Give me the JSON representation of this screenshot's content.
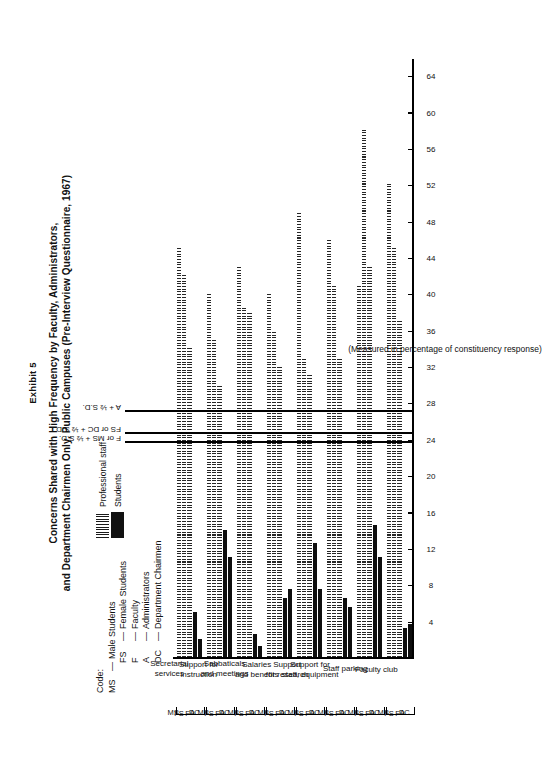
{
  "exhibit": {
    "label": "Exhibit 5"
  },
  "title": {
    "line1": "Concerns Shared with High Frequency by Faculty, Administrators,",
    "line2": "and Department Chairmen Only, Public Campuses (Pre-Interview Questionnaire, 1967)"
  },
  "code_key": {
    "heading": "Code:",
    "dash": "—",
    "entries": [
      {
        "abbr": "MS",
        "meaning": "Male Students"
      },
      {
        "abbr": "FS",
        "meaning": "Female Students"
      },
      {
        "abbr": "F",
        "meaning": "Faculty"
      },
      {
        "abbr": "A",
        "meaning": "Administrators"
      },
      {
        "abbr": "DC",
        "meaning": "Department Chairmen"
      }
    ]
  },
  "pattern_key": [
    {
      "name": "Professional staff",
      "fill": "striped"
    },
    {
      "name": "Students",
      "fill": "solid"
    }
  ],
  "reference_lines": [
    {
      "label": "A + ½  S.D.",
      "value": 27.2
    },
    {
      "label": "FS or DC + ½  S.D.",
      "value": 24.8
    },
    {
      "label": "F or MS + ½  S.D.",
      "value": 23.8
    }
  ],
  "chart_data": {
    "type": "bar",
    "orientation": "horizontal",
    "title": "Concerns Shared with High Frequency by Faculty, Administrators, and Department Chairmen Only, Public Campuses (Pre-Interview Questionnaire, 1967)",
    "xlabel": "(Measured in percentage of constituency response)",
    "ylabel": "",
    "xlim": [
      0,
      66
    ],
    "grid": false,
    "ticks": [
      4,
      8,
      12,
      16,
      20,
      24,
      28,
      32,
      36,
      40,
      44,
      48,
      52,
      56,
      60,
      64
    ],
    "legend_position": "top-left",
    "group_codes": [
      "DC",
      "A",
      "F",
      "FS",
      "MS"
    ],
    "code_order_printed": "MS FS  F   A  DC",
    "series": [
      {
        "name": "Professional staff",
        "fill": "striped",
        "members": [
          "DC",
          "A",
          "F"
        ]
      },
      {
        "name": "Students",
        "fill": "solid",
        "members": [
          "FS",
          "MS"
        ]
      }
    ],
    "categories": [
      {
        "name": "Secretarial services",
        "name_lines": [
          "Secretarial",
          "services"
        ],
        "bars": [
          {
            "code": "DC",
            "value": 45.0,
            "fill": "striped"
          },
          {
            "code": "A",
            "value": 42.0,
            "fill": "striped"
          },
          {
            "code": "F",
            "value": 34.0,
            "fill": "striped"
          },
          {
            "code": "FS",
            "value": 5.0,
            "fill": "solid"
          },
          {
            "code": "MS",
            "value": 2.0,
            "fill": "solid"
          }
        ]
      },
      {
        "name": "Support for instruction",
        "name_lines": [
          "Support for",
          "instruction"
        ],
        "bars": [
          {
            "code": "DC",
            "value": 40.0,
            "fill": "striped"
          },
          {
            "code": "A",
            "value": 35.0,
            "fill": "striped"
          },
          {
            "code": "F",
            "value": 30.0,
            "fill": "striped"
          },
          {
            "code": "FS",
            "value": 14.0,
            "fill": "solid"
          },
          {
            "code": "MS",
            "value": 11.0,
            "fill": "solid"
          }
        ]
      },
      {
        "name": "Sabbaticals and meetings",
        "name_lines": [
          "Sabbaticals",
          "and meetings"
        ],
        "bars": [
          {
            "code": "DC",
            "value": 43.0,
            "fill": "striped"
          },
          {
            "code": "A",
            "value": 38.5,
            "fill": "striped"
          },
          {
            "code": "F",
            "value": 38.0,
            "fill": "striped"
          },
          {
            "code": "FS",
            "value": 2.5,
            "fill": "solid"
          },
          {
            "code": "MS",
            "value": 1.2,
            "fill": "solid"
          }
        ]
      },
      {
        "name": "Salaries and benefits",
        "name_lines": [
          "Salaries",
          "and benefits"
        ],
        "bars": [
          {
            "code": "DC",
            "value": 40.0,
            "fill": "striped"
          },
          {
            "code": "A",
            "value": 36.0,
            "fill": "striped"
          },
          {
            "code": "F",
            "value": 32.0,
            "fill": "striped"
          },
          {
            "code": "FS",
            "value": 6.5,
            "fill": "solid"
          },
          {
            "code": "MS",
            "value": 7.5,
            "fill": "solid"
          }
        ]
      },
      {
        "name": "Support for research",
        "name_lines": [
          "Support",
          "for research"
        ],
        "bars": [
          {
            "code": "DC",
            "value": 49.0,
            "fill": "striped"
          },
          {
            "code": "A",
            "value": 33.0,
            "fill": "striped"
          },
          {
            "code": "F",
            "value": 31.0,
            "fill": "striped"
          },
          {
            "code": "FS",
            "value": 12.5,
            "fill": "solid"
          },
          {
            "code": "MS",
            "value": 7.5,
            "fill": "solid"
          }
        ]
      },
      {
        "name": "Support for staff, equipment",
        "name_lines": [
          "Support for",
          "staff, equipment"
        ],
        "bars": [
          {
            "code": "DC",
            "value": 46.0,
            "fill": "striped"
          },
          {
            "code": "A",
            "value": 41.0,
            "fill": "striped"
          },
          {
            "code": "F",
            "value": 33.0,
            "fill": "striped"
          },
          {
            "code": "FS",
            "value": 6.5,
            "fill": "solid"
          },
          {
            "code": "MS",
            "value": 5.5,
            "fill": "solid"
          }
        ]
      },
      {
        "name": "Staff parking",
        "name_lines": [
          "Staff parking"
        ],
        "bars": [
          {
            "code": "DC",
            "value": 41.0,
            "fill": "striped"
          },
          {
            "code": "A",
            "value": 58.0,
            "fill": "striped"
          },
          {
            "code": "F",
            "value": 43.0,
            "fill": "striped"
          },
          {
            "code": "FS",
            "value": 14.5,
            "fill": "solid"
          },
          {
            "code": "MS",
            "value": 11.0,
            "fill": "solid"
          }
        ]
      },
      {
        "name": "Faculty club",
        "name_lines": [
          "Faculty club"
        ],
        "bars": [
          {
            "code": "DC",
            "value": 52.0,
            "fill": "striped"
          },
          {
            "code": "A",
            "value": 45.0,
            "fill": "striped"
          },
          {
            "code": "F",
            "value": 37.0,
            "fill": "striped"
          },
          {
            "code": "FS",
            "value": 3.2,
            "fill": "solid"
          },
          {
            "code": "MS",
            "value": 3.6,
            "fill": "solid"
          }
        ]
      }
    ]
  }
}
